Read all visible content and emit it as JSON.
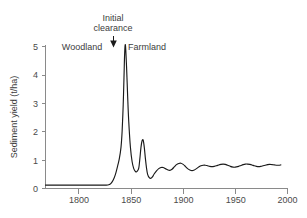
{
  "chart_data": {
    "type": "line",
    "title": "",
    "xlabel": "",
    "ylabel": "Sediment yield (t/ha)",
    "xlim": [
      1768,
      1986
    ],
    "ylim": [
      0,
      5.35
    ],
    "grid": false,
    "legend": "none",
    "x_ticks": [
      1800,
      1850,
      1900,
      1950,
      2000
    ],
    "x_tick_labels": [
      "1800",
      "1850",
      "1900",
      "1950",
      "2000"
    ],
    "y_ticks": [
      0,
      1,
      2,
      3,
      4,
      5
    ],
    "y_tick_labels": [
      "0",
      "1",
      "2",
      "3",
      "4",
      "5"
    ],
    "series": [
      {
        "name": "Sediment yield",
        "color": "#1a1a1a",
        "x": [
          1768,
          1775,
          1785,
          1795,
          1805,
          1812,
          1818,
          1822,
          1825,
          1827,
          1829,
          1831,
          1833,
          1834.5,
          1836,
          1837,
          1838,
          1838.7,
          1839.3,
          1840,
          1841,
          1842,
          1843,
          1844.5,
          1846,
          1847.5,
          1849,
          1850.5,
          1852,
          1853,
          1854,
          1855,
          1856,
          1857,
          1858,
          1859,
          1860,
          1861.5,
          1863,
          1864.5,
          1866,
          1868,
          1870,
          1872,
          1874,
          1876,
          1878,
          1880,
          1882,
          1884,
          1886,
          1888,
          1890,
          1892,
          1894,
          1896,
          1898,
          1900,
          1902,
          1904,
          1906,
          1908,
          1910,
          1912,
          1914,
          1916,
          1918,
          1920,
          1922,
          1924,
          1926,
          1928,
          1930,
          1932,
          1934,
          1936,
          1938,
          1940,
          1942,
          1944,
          1946,
          1948,
          1950,
          1952,
          1954,
          1956,
          1958,
          1960,
          1962,
          1964,
          1966,
          1968,
          1970,
          1972,
          1974,
          1976,
          1978,
          1980
        ],
        "y": [
          0.12,
          0.12,
          0.12,
          0.12,
          0.12,
          0.12,
          0.12,
          0.12,
          0.13,
          0.18,
          0.3,
          0.5,
          0.8,
          1.05,
          1.45,
          2.0,
          2.95,
          3.9,
          4.75,
          5.05,
          4.3,
          3.25,
          2.35,
          1.45,
          0.95,
          0.7,
          0.6,
          0.6,
          0.72,
          1.05,
          1.45,
          1.68,
          1.7,
          1.45,
          1.05,
          0.72,
          0.5,
          0.38,
          0.36,
          0.42,
          0.52,
          0.62,
          0.7,
          0.74,
          0.74,
          0.7,
          0.66,
          0.64,
          0.68,
          0.76,
          0.84,
          0.88,
          0.89,
          0.85,
          0.78,
          0.7,
          0.65,
          0.63,
          0.65,
          0.7,
          0.76,
          0.8,
          0.82,
          0.82,
          0.8,
          0.78,
          0.77,
          0.78,
          0.8,
          0.83,
          0.85,
          0.86,
          0.85,
          0.82,
          0.79,
          0.76,
          0.75,
          0.76,
          0.78,
          0.81,
          0.84,
          0.86,
          0.86,
          0.85,
          0.83,
          0.8,
          0.78,
          0.77,
          0.78,
          0.8,
          0.82,
          0.84,
          0.85,
          0.84,
          0.83,
          0.82,
          0.82,
          0.83
        ]
      }
    ],
    "annotations": [
      {
        "id": "initial-clearance",
        "line1": "Initial",
        "line2": "clearance",
        "x": 1838,
        "y_marker": 5.3,
        "type": "arrow-label"
      },
      {
        "id": "woodland",
        "text": "Woodland",
        "x": 1807,
        "y": 5.0,
        "type": "region-label"
      },
      {
        "id": "farmland",
        "text": "Farmland",
        "x": 1870,
        "y": 5.0,
        "type": "region-label"
      }
    ],
    "colors": {
      "line": "#1a1a1a",
      "axis": "#8a8a8a",
      "text": "#3d3d3d",
      "background": "#ffffff"
    }
  }
}
